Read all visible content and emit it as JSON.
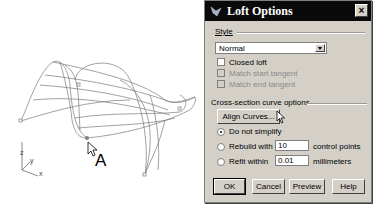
{
  "viewport": {
    "point_label": "A",
    "axis_labels": {
      "z": "z",
      "y": "y",
      "x": "x"
    }
  },
  "dialog": {
    "title": "Loft Options",
    "close_label": "×",
    "style_section_label": "Style",
    "style_selected": "Normal",
    "checkboxes": [
      {
        "label": "Closed loft",
        "checked": false,
        "enabled": true
      },
      {
        "label": "Match start tangent",
        "checked": false,
        "enabled": false
      },
      {
        "label": "Match end tangent",
        "checked": false,
        "enabled": false
      }
    ],
    "cross_section_label": "Cross-section curve options",
    "align_curves_label": "Align Curves...",
    "radios": [
      {
        "label": "Do not simplify",
        "selected": true
      },
      {
        "label": "Rebuild with",
        "selected": false,
        "value": "10",
        "unit": "control points"
      },
      {
        "label": "Refit within",
        "selected": false,
        "value": "0.01",
        "unit": "millimeters"
      }
    ],
    "buttons": {
      "ok": "OK",
      "cancel": "Cancel",
      "preview": "Preview",
      "help": "Help"
    }
  }
}
